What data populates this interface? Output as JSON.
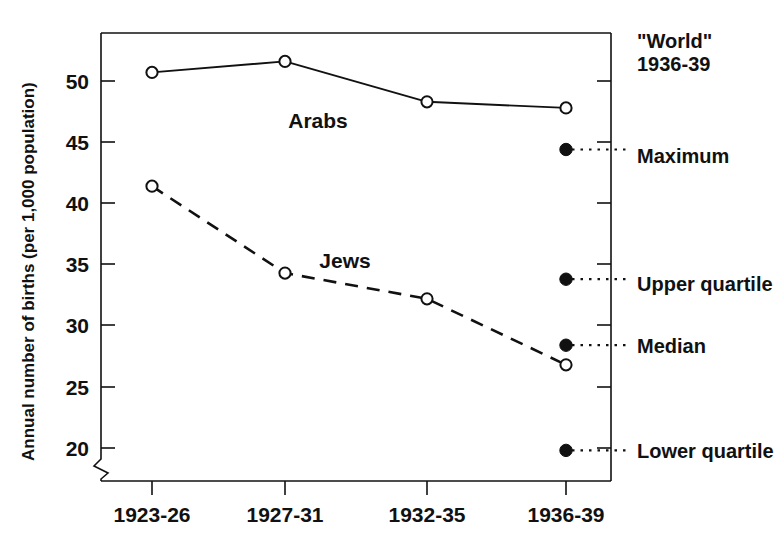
{
  "chart_data": {
    "type": "line",
    "title": "",
    "xlabel": "",
    "ylabel": "Annual number of births (per 1,000 population)",
    "categories": [
      "1923-26",
      "1927-31",
      "1932-35",
      "1936-39"
    ],
    "ylim": [
      18.5,
      53.5
    ],
    "yticks": [
      20,
      25,
      30,
      35,
      40,
      45,
      50
    ],
    "ytick_labels": [
      "20",
      "25",
      "30",
      "35",
      "40",
      "45",
      "50"
    ],
    "grid": false,
    "legend_position": "inline-annotation",
    "axis_break": true,
    "series": [
      {
        "name": "Arabs",
        "style": "solid",
        "marker": "open-circle",
        "values": [
          50.7,
          51.6,
          48.3,
          47.8
        ]
      },
      {
        "name": "Jews",
        "style": "dashed",
        "marker": "open-circle",
        "values": [
          41.4,
          34.3,
          32.2,
          26.8
        ]
      }
    ],
    "reference_group": {
      "header_line1": "\"World\"",
      "header_line2": "1936-39",
      "marker": "filled-circle",
      "points": [
        {
          "label": "Maximum",
          "value": 44.4
        },
        {
          "label": "Upper quartile",
          "value": 33.8
        },
        {
          "label": "Median",
          "value": 28.4
        },
        {
          "label": "Lower quartile",
          "value": 19.8
        }
      ]
    },
    "annotations": [
      {
        "text": "Arabs",
        "series": "Arabs"
      },
      {
        "text": "Jews",
        "series": "Jews"
      }
    ]
  },
  "colors": {
    "ink": "#111111",
    "background": "#ffffff"
  }
}
